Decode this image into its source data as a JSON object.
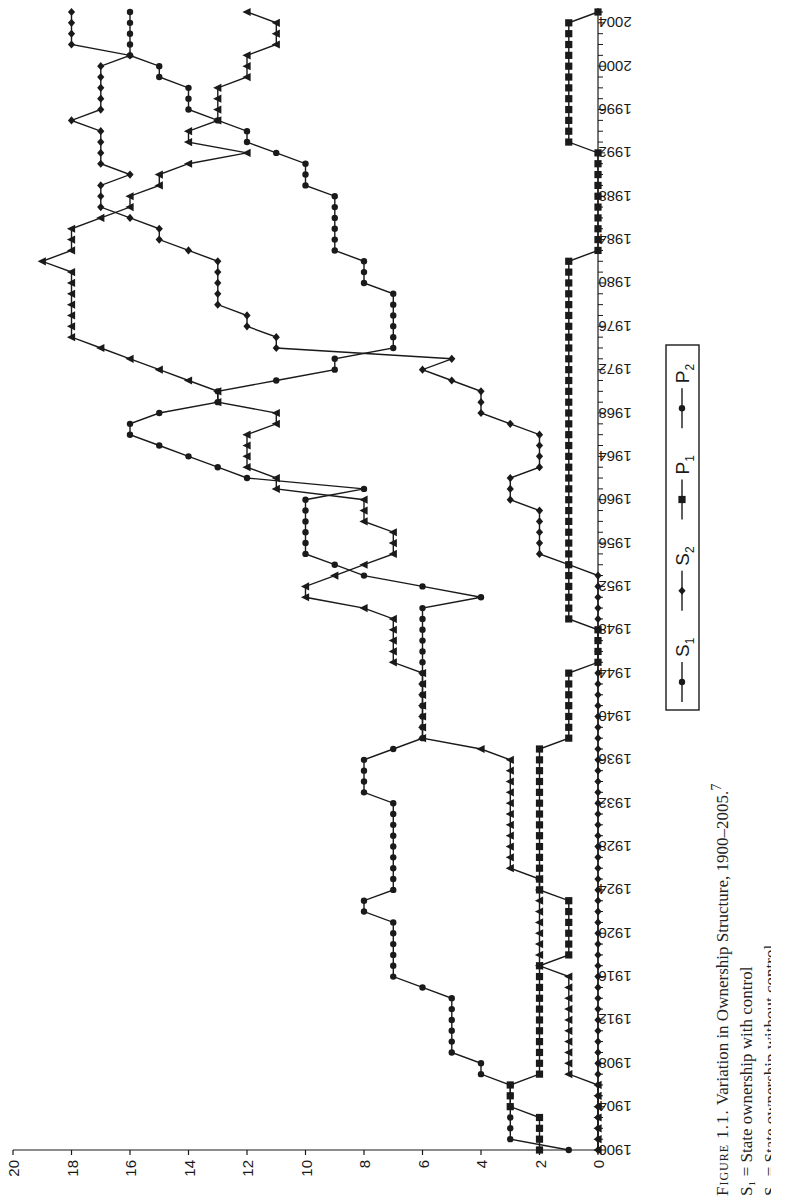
{
  "caption": {
    "figure_label": "Figure 1.1.",
    "title": "Variation in Ownership Structure, 1900–2005.",
    "footnote_marker": "7",
    "definitions": [
      "S₁ = State ownership with control",
      "S₂ = State ownership without control"
    ]
  },
  "chart_data": {
    "type": "line",
    "orientation": "rotated 90° counter-clockwise (years run bottom-to-top, values right-to-left)",
    "title": "Variation in Ownership Structure, 1900–2005",
    "xlabel": "Year",
    "ylabel": "",
    "ylim": [
      0,
      20
    ],
    "yticks": [
      0,
      2,
      4,
      6,
      8,
      10,
      12,
      14,
      16,
      18,
      20
    ],
    "xlim": [
      1900,
      2005
    ],
    "xticks": [
      1900,
      1904,
      1908,
      1912,
      1916,
      1920,
      1924,
      1928,
      1932,
      1936,
      1940,
      1944,
      1948,
      1952,
      1956,
      1960,
      1964,
      1968,
      1972,
      1976,
      1980,
      1984,
      1988,
      1992,
      1996,
      2000,
      2004
    ],
    "grid": false,
    "legend": {
      "position": "inside, boxed",
      "entries": [
        "S1",
        "S2",
        "P1",
        "P2"
      ]
    },
    "x": [
      1900,
      1901,
      1902,
      1903,
      1904,
      1905,
      1906,
      1907,
      1908,
      1909,
      1910,
      1911,
      1912,
      1913,
      1914,
      1915,
      1916,
      1917,
      1918,
      1919,
      1920,
      1921,
      1922,
      1923,
      1924,
      1925,
      1926,
      1927,
      1928,
      1929,
      1930,
      1931,
      1932,
      1933,
      1934,
      1935,
      1936,
      1937,
      1938,
      1939,
      1940,
      1941,
      1942,
      1943,
      1944,
      1945,
      1946,
      1947,
      1948,
      1949,
      1950,
      1951,
      1952,
      1953,
      1954,
      1955,
      1956,
      1957,
      1958,
      1959,
      1960,
      1961,
      1962,
      1963,
      1964,
      1965,
      1966,
      1967,
      1968,
      1969,
      1970,
      1971,
      1972,
      1973,
      1974,
      1975,
      1976,
      1977,
      1978,
      1979,
      1980,
      1981,
      1982,
      1983,
      1984,
      1985,
      1986,
      1987,
      1988,
      1989,
      1990,
      1991,
      1992,
      1993,
      1994,
      1995,
      1996,
      1997,
      1998,
      1999,
      2000,
      2001,
      2002,
      2003,
      2004,
      2005
    ],
    "series": [
      {
        "name": "S1",
        "marker": "triangle",
        "values": [
          0,
          0,
          0,
          0,
          0,
          0,
          0,
          1,
          1,
          1,
          1,
          1,
          1,
          1,
          1,
          1,
          1,
          2,
          2,
          2,
          2,
          2,
          2,
          2,
          2,
          2,
          3,
          3,
          3,
          3,
          3,
          3,
          3,
          3,
          3,
          3,
          3,
          4,
          6,
          6,
          6,
          6,
          6,
          6,
          6,
          7,
          7,
          7,
          7,
          7,
          8,
          10,
          10,
          9,
          8,
          7,
          7,
          7,
          8,
          8,
          8,
          11,
          11,
          12,
          12,
          12,
          12,
          11,
          11,
          13,
          13,
          14,
          15,
          16,
          17,
          18,
          18,
          18,
          18,
          18,
          18,
          18,
          19,
          18,
          18,
          18,
          17,
          16,
          16,
          15,
          15,
          14,
          12,
          14,
          14,
          13,
          13,
          13,
          13,
          12,
          12,
          12,
          11,
          11,
          11,
          12
        ]
      },
      {
        "name": "S2",
        "marker": "diamond",
        "values": [
          0,
          0,
          0,
          0,
          0,
          0,
          0,
          0,
          0,
          0,
          0,
          0,
          0,
          0,
          0,
          0,
          0,
          0,
          0,
          0,
          0,
          0,
          0,
          0,
          0,
          0,
          0,
          0,
          0,
          0,
          0,
          0,
          0,
          0,
          0,
          0,
          0,
          0,
          0,
          0,
          0,
          0,
          0,
          0,
          0,
          0,
          0,
          0,
          0,
          0,
          0,
          0,
          0,
          0,
          1,
          2,
          2,
          2,
          2,
          2,
          3,
          3,
          3,
          2,
          2,
          2,
          2,
          3,
          4,
          4,
          4,
          5,
          6,
          5,
          11,
          11,
          12,
          12,
          13,
          13,
          13,
          13,
          13,
          14,
          15,
          15,
          16,
          17,
          17,
          17,
          16,
          17,
          17,
          17,
          17,
          18,
          17,
          17,
          17,
          17,
          17,
          16,
          18,
          18,
          18,
          18
        ]
      },
      {
        "name": "P1",
        "marker": "square",
        "values": [
          2,
          2,
          2,
          2,
          3,
          3,
          3,
          2,
          2,
          2,
          2,
          2,
          2,
          2,
          2,
          2,
          2,
          2,
          1,
          1,
          1,
          1,
          1,
          1,
          2,
          2,
          2,
          2,
          2,
          2,
          2,
          2,
          2,
          2,
          2,
          2,
          2,
          2,
          1,
          1,
          1,
          1,
          1,
          1,
          1,
          0,
          0,
          0,
          0,
          1,
          1,
          1,
          1,
          1,
          1,
          1,
          1,
          1,
          1,
          1,
          1,
          1,
          1,
          1,
          1,
          1,
          1,
          1,
          1,
          1,
          1,
          1,
          1,
          1,
          1,
          1,
          1,
          1,
          1,
          1,
          1,
          1,
          1,
          0,
          0,
          0,
          0,
          0,
          0,
          0,
          0,
          0,
          0,
          1,
          1,
          1,
          1,
          1,
          1,
          1,
          1,
          1,
          1,
          1,
          1,
          0
        ]
      },
      {
        "name": "P2",
        "marker": "circle",
        "values": [
          1,
          3,
          3,
          3,
          3,
          3,
          3,
          4,
          4,
          5,
          5,
          5,
          5,
          5,
          5,
          6,
          7,
          7,
          7,
          7,
          7,
          7,
          8,
          8,
          7,
          7,
          7,
          7,
          7,
          7,
          7,
          7,
          7,
          8,
          8,
          8,
          8,
          7,
          6,
          6,
          6,
          6,
          6,
          6,
          6,
          6,
          6,
          6,
          6,
          6,
          6,
          4,
          6,
          8,
          9,
          10,
          10,
          10,
          10,
          10,
          10,
          8,
          12,
          13,
          14,
          15,
          16,
          16,
          15,
          13,
          13,
          11,
          9,
          9,
          7,
          7,
          7,
          7,
          7,
          7,
          8,
          8,
          8,
          9,
          9,
          9,
          9,
          9,
          9,
          10,
          10,
          10,
          11,
          12,
          12,
          13,
          14,
          14,
          14,
          15,
          15,
          16,
          16,
          16,
          16,
          16
        ]
      }
    ]
  },
  "colors": {
    "ink": "#1a1a1a",
    "background": "#ffffff"
  }
}
